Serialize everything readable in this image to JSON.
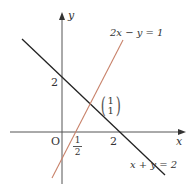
{
  "diagram": {
    "axes": {
      "x_label": "x",
      "y_label": "y",
      "origin_label": "O"
    },
    "ticks": {
      "y_intercept_label": "2",
      "x_intercept_black_label": "2",
      "x_intercept_orange": {
        "numerator": "1",
        "denominator": "2"
      }
    },
    "lines": [
      {
        "name": "black-line",
        "equation": "x + y = 2",
        "color": "#222222"
      },
      {
        "name": "orange-line",
        "equation": "2x − y = 1",
        "color": "#c8826a"
      }
    ],
    "intersection": {
      "vector_top": "1",
      "vector_bottom": "1"
    },
    "colors": {
      "axis": "#555555",
      "black_line": "#222222",
      "orange_line": "#c8826a",
      "text": "#333333"
    }
  }
}
